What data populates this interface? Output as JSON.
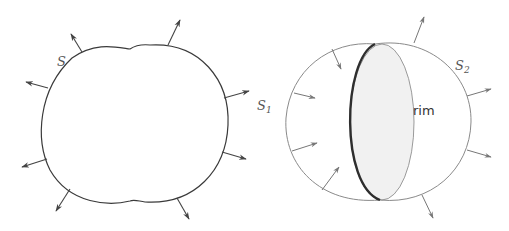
{
  "figure": {
    "left": {
      "title": "closed-surface",
      "label": "S",
      "label_pos": [
        57,
        66
      ],
      "outline": "M 72 58 C 95 42, 115 47, 130 49 C 133 47, 140 44, 150 45 C 200 42, 230 80, 228 125 C 226 170, 195 205, 145 202 C 138 201, 134 199, 130 201 C 110 206, 70 205, 50 170 C 35 140, 38 90, 72 58 Z",
      "normals": [
        {
          "x1": 82,
          "y1": 52,
          "x2": 71,
          "y2": 34
        },
        {
          "x1": 168,
          "y1": 45,
          "x2": 180,
          "y2": 20
        },
        {
          "x1": 48,
          "y1": 88,
          "x2": 26,
          "y2": 82
        },
        {
          "x1": 47,
          "y1": 159,
          "x2": 22,
          "y2": 167
        },
        {
          "x1": 70,
          "y1": 189,
          "x2": 56,
          "y2": 211
        },
        {
          "x1": 177,
          "y1": 198,
          "x2": 189,
          "y2": 219
        },
        {
          "x1": 224,
          "y1": 98,
          "x2": 249,
          "y2": 91
        },
        {
          "x1": 222,
          "y1": 152,
          "x2": 246,
          "y2": 159
        }
      ]
    },
    "right": {
      "title": "two-caps-with-rim",
      "s1_label": "S",
      "s1_sub": "1",
      "s1_label_pos": [
        257,
        110
      ],
      "s2_label": "S",
      "s2_sub": "2",
      "s2_label_pos": [
        455,
        70
      ],
      "rim_label": "rim",
      "rim_label_pos": [
        413,
        115
      ],
      "s1_arc": "M 375 44 C 330 40, 290 70, 286 118 C 283 165, 320 205, 380 200",
      "s2_arc": "M 375 44 C 430 36, 472 75, 471 122 C 470 170, 430 205, 380 200",
      "rim_ellipse": {
        "cx": 382,
        "cy": 122,
        "rx": 32,
        "ry": 78
      },
      "rim_front": "M 375 44 C 342 60, 340 185, 380 200",
      "s1_normals": [
        {
          "x1": 332,
          "y1": 49,
          "x2": 341,
          "y2": 69
        },
        {
          "x1": 294,
          "y1": 93,
          "x2": 315,
          "y2": 98
        },
        {
          "x1": 292,
          "y1": 151,
          "x2": 317,
          "y2": 143
        },
        {
          "x1": 322,
          "y1": 190,
          "x2": 339,
          "y2": 167
        }
      ],
      "s2_normals": [
        {
          "x1": 414,
          "y1": 43,
          "x2": 424,
          "y2": 17
        },
        {
          "x1": 467,
          "y1": 96,
          "x2": 491,
          "y2": 89
        },
        {
          "x1": 467,
          "y1": 150,
          "x2": 491,
          "y2": 157
        },
        {
          "x1": 422,
          "y1": 195,
          "x2": 433,
          "y2": 218
        }
      ]
    }
  },
  "colors": {
    "stroke_dark": "#3a3a3a",
    "stroke_light": "#8a8a8a",
    "rim_fill": "#f1f1f1"
  }
}
